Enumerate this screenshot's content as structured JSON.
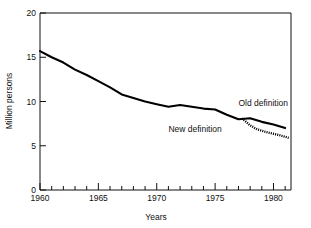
{
  "chart_data": {
    "type": "line",
    "title": "",
    "xlabel": "Years",
    "ylabel": "Million persons",
    "xlim": [
      1960,
      1981.5
    ],
    "ylim": [
      0,
      20
    ],
    "grid": false,
    "legend_position": "inline-annotations",
    "x_ticks_major": [
      1960,
      1965,
      1970,
      1975,
      1980
    ],
    "x_tick_labels": [
      "1960",
      "1965",
      "1970",
      "1975",
      "1980"
    ],
    "x_minor_tick_step": 1,
    "y_ticks_major": [
      0,
      5,
      10,
      15,
      20
    ],
    "y_tick_labels": [
      "0",
      "5",
      "10",
      "15",
      "20"
    ],
    "series": [
      {
        "name": "Old definition",
        "style": "solid",
        "x": [
          1960,
          1961,
          1962,
          1963,
          1964,
          1965,
          1966,
          1967,
          1968,
          1969,
          1970,
          1971,
          1972,
          1973,
          1974,
          1975,
          1976,
          1977,
          1978,
          1979,
          1980,
          1981
        ],
        "values": [
          15.7,
          15.0,
          14.4,
          13.6,
          13.0,
          12.3,
          11.6,
          10.8,
          10.4,
          10.0,
          9.7,
          9.4,
          9.6,
          9.4,
          9.2,
          9.1,
          8.5,
          8.0,
          8.1,
          7.7,
          7.4,
          7.0
        ]
      },
      {
        "name": "New definition",
        "style": "dotted",
        "x": [
          1977.3,
          1978,
          1978.6,
          1979.5,
          1980.5,
          1981.3
        ],
        "values": [
          8.1,
          7.3,
          6.85,
          6.5,
          6.2,
          5.9
        ]
      }
    ],
    "annotations": [
      {
        "text": "Old definition",
        "x": 1977.0,
        "y": 9.5,
        "anchor": "start"
      },
      {
        "text": "New definition",
        "x": 1971.0,
        "y": 6.5,
        "anchor": "start"
      }
    ]
  }
}
